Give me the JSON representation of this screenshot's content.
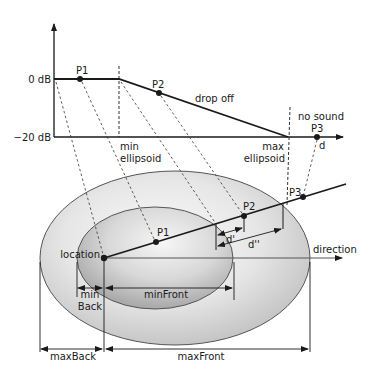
{
  "graph": {
    "y_top_label": "0 dB",
    "y_bottom_label": "−20 dB",
    "points": {
      "p1": "P1",
      "p2": "P2",
      "p3": "P3"
    },
    "drop_off_label": "drop off",
    "no_sound_label": "no sound",
    "min_label_line1": "min",
    "min_label_line2": "ellipsoid",
    "max_label_line1": "max",
    "max_label_line2": "ellipsoid",
    "x_axis_label": "d"
  },
  "ellipsoid": {
    "location_label": "location",
    "direction_label": "direction",
    "p1": "P1",
    "p2": "P2",
    "p3": "P3",
    "d_prime": "d'",
    "d_double_prime": "d''",
    "min_back_line1": "min",
    "min_back_line2": "Back",
    "min_front": "minFront",
    "max_back": "maxBack",
    "max_front": "maxFront"
  },
  "colors": {
    "line": "#1a1a1a",
    "outer_fill_light": "#f4f4f4",
    "outer_fill_dark": "#c8c8c8",
    "inner_fill_light": "#f8f8f8",
    "inner_fill_dark": "#b4b4b4"
  }
}
